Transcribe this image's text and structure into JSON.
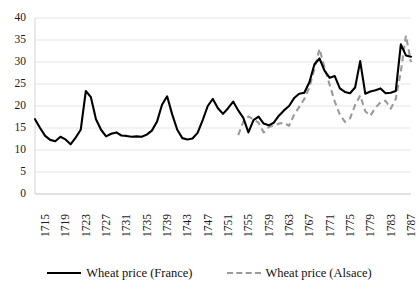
{
  "chart_data": {
    "type": "line",
    "title": "",
    "xlabel": "",
    "ylabel": "",
    "ylim": [
      0,
      40
    ],
    "ytick_step": 5,
    "yticks": [
      0,
      5,
      10,
      15,
      20,
      25,
      30,
      35,
      40
    ],
    "xlim": [
      1715,
      1789
    ],
    "xticks": [
      1715,
      1719,
      1723,
      1727,
      1731,
      1735,
      1739,
      1743,
      1747,
      1751,
      1755,
      1759,
      1763,
      1767,
      1771,
      1775,
      1779,
      1783,
      1787
    ],
    "grid": "horizontal",
    "legend_position": "bottom",
    "x": [
      1715,
      1716,
      1717,
      1718,
      1719,
      1720,
      1721,
      1722,
      1723,
      1724,
      1725,
      1726,
      1727,
      1728,
      1729,
      1730,
      1731,
      1732,
      1733,
      1734,
      1735,
      1736,
      1737,
      1738,
      1739,
      1740,
      1741,
      1742,
      1743,
      1744,
      1745,
      1746,
      1747,
      1748,
      1749,
      1750,
      1751,
      1752,
      1753,
      1754,
      1755,
      1756,
      1757,
      1758,
      1759,
      1760,
      1761,
      1762,
      1763,
      1764,
      1765,
      1766,
      1767,
      1768,
      1769,
      1770,
      1771,
      1772,
      1773,
      1774,
      1775,
      1776,
      1777,
      1778,
      1779,
      1780,
      1781,
      1782,
      1783,
      1784,
      1785,
      1786,
      1787,
      1788,
      1789
    ],
    "series": [
      {
        "name": "Wheat price (France)",
        "style": "solid",
        "color": "#000000",
        "values": [
          17.0,
          15.0,
          13.2,
          12.3,
          12.0,
          13.0,
          12.4,
          11.3,
          12.8,
          14.6,
          23.4,
          22.0,
          17.0,
          14.6,
          13.1,
          13.7,
          14.0,
          13.3,
          13.2,
          13.0,
          13.1,
          13.0,
          13.5,
          14.4,
          16.4,
          20.3,
          22.2,
          18.1,
          14.6,
          12.7,
          12.4,
          12.6,
          13.9,
          16.8,
          20.0,
          21.6,
          19.5,
          18.2,
          19.5,
          21.0,
          19.0,
          17.3,
          14.0,
          16.8,
          17.6,
          16.0,
          15.6,
          16.2,
          17.8,
          19.0,
          20.0,
          21.8,
          22.8,
          23.0,
          25.4,
          29.5,
          30.8,
          28.0,
          26.4,
          26.8,
          24.0,
          23.2,
          22.9,
          24.2,
          30.2,
          22.8,
          23.3,
          23.6,
          24.0,
          22.9,
          23.0,
          23.4,
          34.0,
          31.5,
          31.2
        ]
      },
      {
        "name": "Wheat price (Alsace)",
        "style": "dashed",
        "color": "#9a9a9a",
        "values": [
          null,
          null,
          null,
          null,
          null,
          null,
          null,
          null,
          null,
          null,
          null,
          null,
          null,
          null,
          null,
          null,
          null,
          null,
          null,
          null,
          null,
          null,
          null,
          null,
          null,
          null,
          null,
          null,
          null,
          null,
          null,
          null,
          null,
          null,
          null,
          null,
          null,
          null,
          null,
          null,
          13.4,
          16.4,
          17.6,
          17.0,
          16.2,
          14.0,
          15.2,
          15.6,
          16.0,
          16.2,
          15.5,
          18.0,
          19.8,
          21.6,
          24.2,
          28.5,
          33.0,
          28.6,
          24.8,
          21.0,
          18.0,
          16.4,
          17.2,
          20.2,
          22.4,
          18.8,
          17.8,
          19.6,
          20.8,
          21.2,
          19.4,
          21.6,
          27.8,
          36.0,
          30.0
        ]
      }
    ]
  },
  "axes": {
    "ytick_labels": [
      "40",
      "35",
      "30",
      "25",
      "20",
      "15",
      "10",
      "5",
      "0"
    ],
    "xtick_labels": [
      "1715",
      "1719",
      "1723",
      "1727",
      "1731",
      "1735",
      "1739",
      "1743",
      "1747",
      "1751",
      "1755",
      "1759",
      "1763",
      "1767",
      "1771",
      "1775",
      "1779",
      "1783",
      "1787"
    ]
  },
  "legend": {
    "entries": [
      {
        "label": "Wheat price (France)",
        "style": "solid",
        "color": "#000000"
      },
      {
        "label": "Wheat price (Alsace)",
        "style": "dashed",
        "color": "#9a9a9a"
      }
    ]
  },
  "colors": {
    "france": "#000000",
    "alsace": "#9a9a9a",
    "grid": "#e2e2e2",
    "axis": "#d4d4d4",
    "text": "#1a1a1a",
    "background": "#ffffff"
  }
}
